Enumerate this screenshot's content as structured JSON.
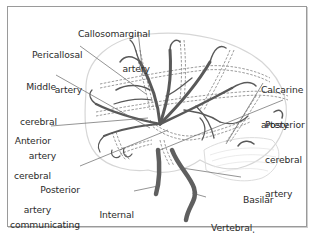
{
  "diagram": {
    "colors": {
      "artery": "#555555",
      "brain_outline": "#d4d4d4",
      "hidden_artery_dash": "#9a9a9a",
      "leader_line": "#555555",
      "label_text": "#2b2b2b",
      "frame": "#9a9a9a"
    },
    "labels": {
      "callosomarginal": [
        "Callosomarginal",
        "artery"
      ],
      "pericallosal": [
        "Pericallosal",
        "artery"
      ],
      "middle_cerebral": [
        "Middle",
        "cerebral",
        "artery"
      ],
      "anterior_cerebral": [
        "Anterior",
        "cerebral",
        "artery"
      ],
      "posterior_communicating": [
        "Posterior",
        "communicating",
        "artery"
      ],
      "internal_carotid": [
        "Internal",
        "carotid",
        "artery"
      ],
      "calcarine": [
        "Calcarine",
        "artery"
      ],
      "posterior_cerebral": [
        "Posterior",
        "cerebral",
        "artery"
      ],
      "basilar": [
        "Basilar",
        "artery"
      ],
      "vertebral": [
        "Vertebral",
        "artery"
      ]
    }
  }
}
